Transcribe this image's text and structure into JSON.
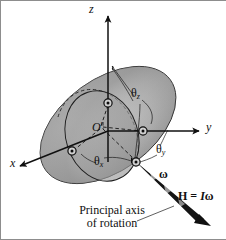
{
  "figure": {
    "background_color": "#ffffff",
    "ink_color": "#101010",
    "body_fill_light": "#d9d9d9",
    "body_fill_mid": "#b5b5b5",
    "body_fill_dark": "#8f8f8f",
    "frame_color": "#8d8d8d"
  },
  "axes": {
    "z": {
      "label": "z",
      "x": 89,
      "y": 8
    },
    "y": {
      "label": "y",
      "x": 206,
      "y": 127
    },
    "x": {
      "label": "x",
      "x": 10,
      "y": 163
    }
  },
  "origin": {
    "label": "O",
    "prime": "′",
    "x": 92,
    "y": 128
  },
  "angles": [
    {
      "name": "theta-z",
      "symbol": "θ",
      "subscript": "z",
      "x": 134,
      "y": 93
    },
    {
      "name": "theta-y",
      "symbol": "θ",
      "subscript": "y",
      "x": 158,
      "y": 147
    },
    {
      "name": "theta-x",
      "symbol": "θ",
      "subscript": "x",
      "x": 96,
      "y": 157
    }
  ],
  "vectors": {
    "omega": {
      "label": "ω",
      "x": 160,
      "y": 172
    },
    "angular_momentum": {
      "label_h": "H",
      "label_eq": " = ",
      "label_i": "I",
      "label_omega": "ω",
      "x": 181,
      "y": 196
    }
  },
  "caption": {
    "line1": "Principal axis",
    "line2": "of rotation",
    "x": 66,
    "y": 207
  },
  "markers": [
    {
      "name": "particle-marker-z-axis",
      "cx": 108,
      "cy": 103
    },
    {
      "name": "particle-marker-y-axis",
      "cx": 143,
      "cy": 131
    },
    {
      "name": "particle-marker-x-axis",
      "cx": 72,
      "cy": 151
    },
    {
      "name": "particle-marker-spin-axis",
      "cx": 136,
      "cy": 162
    }
  ]
}
